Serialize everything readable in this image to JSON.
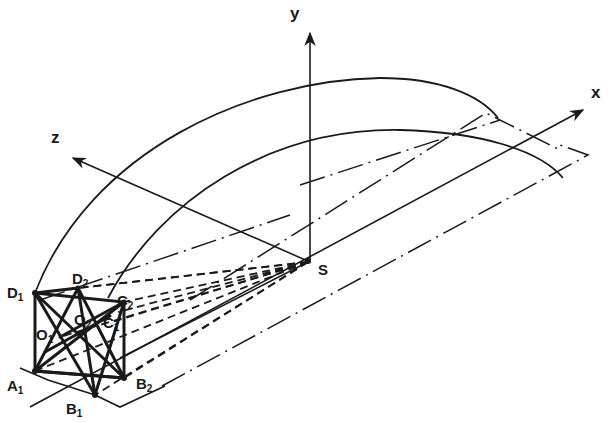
{
  "figure": {
    "type": "3D geometric projection diagram",
    "axes": {
      "x": {
        "label": "x"
      },
      "y": {
        "label": "y"
      },
      "z": {
        "label": "z"
      }
    },
    "origin_point": {
      "label": "S"
    },
    "points": [
      {
        "id": "D1",
        "base": "D",
        "sub": "1"
      },
      {
        "id": "D2",
        "base": "D",
        "sub": "2"
      },
      {
        "id": "C2",
        "base": "C",
        "sub": "2"
      },
      {
        "id": "C1",
        "base": "C",
        "sub": "1"
      },
      {
        "id": "O2",
        "base": "O",
        "sub": "2"
      },
      {
        "id": "O1",
        "base": "O",
        "sub": "1"
      },
      {
        "id": "A1",
        "base": "A",
        "sub": "1"
      },
      {
        "id": "B2",
        "base": "B",
        "sub": "2"
      },
      {
        "id": "B1",
        "base": "B",
        "sub": "1"
      }
    ],
    "colors": {
      "ink": "#1a1a1a",
      "background": "#ffffff"
    }
  }
}
